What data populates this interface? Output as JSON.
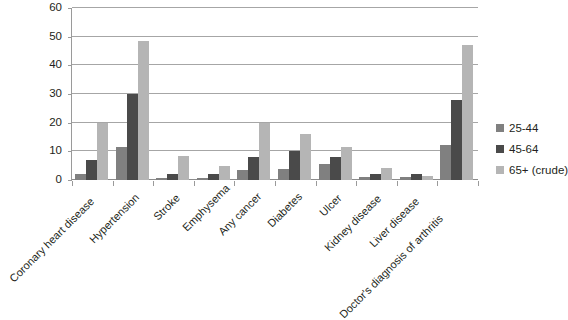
{
  "chart_data": {
    "type": "bar",
    "title": "",
    "subtitle": "",
    "xlabel": "",
    "ylabel": "",
    "ylim": [
      0,
      60
    ],
    "yticks": [
      0,
      10,
      20,
      30,
      40,
      50,
      60
    ],
    "grid": true,
    "legend_position": "right",
    "categories": [
      "Coronary heart disease",
      "Hypertension",
      "Stroke",
      "Emphysema",
      "Any cancer",
      "Diabetes",
      "Ulcer",
      "Kidney disease",
      "Liver disease",
      "Doctor's diagnosis of arthritis"
    ],
    "series": [
      {
        "name": "25-44",
        "color": "#808080",
        "values": [
          2.0,
          11.5,
          0.8,
          0.7,
          3.5,
          3.8,
          5.5,
          1.2,
          1.2,
          12.3
        ]
      },
      {
        "name": "45-64",
        "color": "#4a4a4a",
        "values": [
          7.0,
          30.0,
          2.2,
          2.0,
          8.0,
          10.0,
          8.0,
          2.0,
          2.2,
          28.0
        ]
      },
      {
        "name": "65+ (crude)",
        "color": "#b5b5b5",
        "values": [
          20.0,
          48.5,
          8.5,
          5.0,
          20.0,
          16.0,
          11.5,
          4.2,
          1.5,
          47.0
        ]
      }
    ]
  },
  "legend": {
    "items": [
      {
        "label": "25-44",
        "color": "#808080"
      },
      {
        "label": "45-64",
        "color": "#4a4a4a"
      },
      {
        "label": "65+ (crude)",
        "color": "#b5b5b5"
      }
    ]
  },
  "axis": {
    "y_tick_labels": [
      "0",
      "10",
      "20",
      "30",
      "40",
      "50",
      "60"
    ]
  }
}
